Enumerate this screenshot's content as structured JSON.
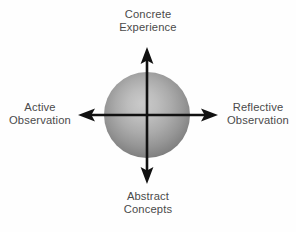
{
  "diagram": {
    "background_color": "#fefefe",
    "text_color": "#4a4a4a",
    "axis_color": "#111111",
    "sphere": {
      "name": "gray-sphere",
      "center_x": 147,
      "center_y": 115,
      "radius": 43,
      "highlight_color": "#c4c4c4",
      "mid_color": "#a3a3a3",
      "edge_color": "#787878"
    },
    "axes": [
      {
        "name": "vertical-axis",
        "orientation": "vertical",
        "from_label": "Abstract Concepts",
        "to_label": "Concrete Experience",
        "double_headed": true
      },
      {
        "name": "horizontal-axis",
        "orientation": "horizontal",
        "from_label": "Active Observation",
        "to_label": "Reflective Observation",
        "double_headed": true
      }
    ],
    "labels": {
      "top": {
        "name": "concrete-experience",
        "line1": "Concrete",
        "line2": "Experience",
        "position": "top"
      },
      "bottom": {
        "name": "abstract-concepts",
        "line1": "Abstract",
        "line2": "Concepts",
        "position": "bottom"
      },
      "left": {
        "name": "active-observation",
        "line1": "Active",
        "line2": "Observation",
        "position": "left"
      },
      "right": {
        "name": "reflective-observation",
        "line1": "Reflective",
        "line2": "Observation",
        "position": "right"
      }
    }
  }
}
